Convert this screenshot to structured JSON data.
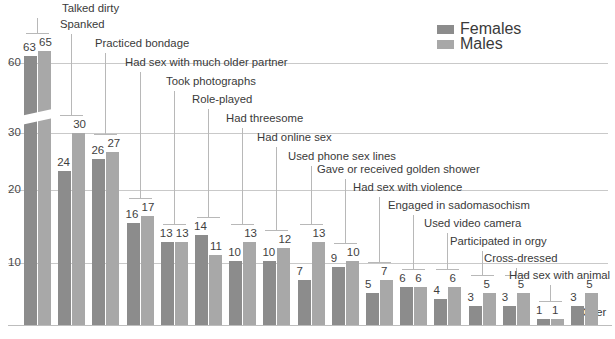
{
  "legend": {
    "position": "top-right",
    "entries": [
      {
        "label": "Females",
        "color": "#8c8c8c"
      },
      {
        "label": "Males",
        "color": "#a8a8a8"
      }
    ]
  },
  "axis": {
    "ticks": [
      "10",
      "20",
      "30",
      "60"
    ],
    "broken": true,
    "break_between": [
      30,
      60
    ]
  },
  "other_label": "Other",
  "chart_data": {
    "type": "bar",
    "title": "",
    "xlabel": "",
    "ylabel": "",
    "ylim": [
      0,
      70
    ],
    "grid": true,
    "axis_break": [
      30,
      60
    ],
    "legend_position": "top-right",
    "categories": [
      "Talked dirty",
      "Spanked",
      "Practiced bondage",
      "Had sex with much older partner",
      "Took photographs",
      "Role-played",
      "Had threesome",
      "Had online sex",
      "Used phone sex lines",
      "Gave or received golden shower",
      "Had sex with violence",
      "Engaged in sadomasochism",
      "Used video camera",
      "Participated in orgy",
      "Cross-dressed",
      "Had sex with animal",
      "Other"
    ],
    "series": [
      {
        "name": "Females",
        "color": "#8c8c8c",
        "values": [
          63,
          24,
          26,
          16,
          13,
          14,
          10,
          10,
          7,
          9,
          5,
          6,
          4,
          3,
          3,
          1,
          3
        ]
      },
      {
        "name": "Males",
        "color": "#a8a8a8",
        "values": [
          65,
          30,
          27,
          17,
          13,
          11,
          13,
          12,
          13,
          10,
          7,
          6,
          6,
          5,
          5,
          1,
          5
        ]
      }
    ]
  }
}
